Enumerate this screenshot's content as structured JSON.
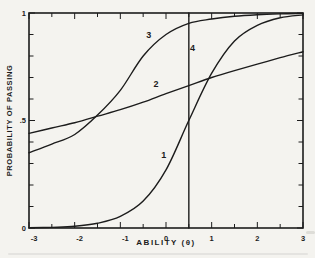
{
  "figure": {
    "background": "#f4f3ef",
    "ink": "#1c1c1c"
  },
  "chart_data": {
    "type": "line",
    "title": "",
    "xlabel": "ABILITY (θ)",
    "ylabel": "PROBABILITY OF PASSING",
    "xlim": [
      -3,
      3
    ],
    "ylim": [
      0,
      1
    ],
    "grid": false,
    "legend_position": "inline-curve-number-labels",
    "x_minor_tick_step": 0.5,
    "y_minor_tick_step": 0.1,
    "x_tick_labels": [
      {
        "value": -3,
        "label": "-3"
      },
      {
        "value": -2,
        "label": "-2"
      },
      {
        "value": -1,
        "label": "-1"
      },
      {
        "value": 0,
        "label": "0"
      },
      {
        "value": 1,
        "label": "1"
      },
      {
        "value": 2,
        "label": "2"
      },
      {
        "value": 3,
        "label": "3"
      }
    ],
    "y_tick_labels": [
      {
        "value": 0,
        "label": "0"
      },
      {
        "value": 0.5,
        "label": ".5"
      },
      {
        "value": 1,
        "label": "1"
      }
    ],
    "series": [
      {
        "name": "item-1",
        "label": "1",
        "label_at": {
          "x": -0.05,
          "y": 0.325
        },
        "shape": "ogive",
        "points": [
          [
            -3,
            0.001
          ],
          [
            -2.5,
            0.003
          ],
          [
            -2,
            0.008
          ],
          [
            -1.5,
            0.022
          ],
          [
            -1,
            0.054
          ],
          [
            -0.5,
            0.125
          ],
          [
            0,
            0.27
          ],
          [
            0.5,
            0.5
          ],
          [
            1,
            0.72
          ],
          [
            1.5,
            0.87
          ],
          [
            2,
            0.943
          ],
          [
            2.5,
            0.978
          ],
          [
            3,
            0.991
          ]
        ]
      },
      {
        "name": "item-2",
        "label": "2",
        "label_at": {
          "x": -0.22,
          "y": 0.655
        },
        "shape": "ogive",
        "points": [
          [
            -3,
            0.44
          ],
          [
            -2.5,
            0.465
          ],
          [
            -2,
            0.49
          ],
          [
            -1.5,
            0.52
          ],
          [
            -1,
            0.55
          ],
          [
            -0.5,
            0.585
          ],
          [
            0,
            0.625
          ],
          [
            0.5,
            0.662
          ],
          [
            1,
            0.7
          ],
          [
            1.5,
            0.732
          ],
          [
            2,
            0.762
          ],
          [
            2.5,
            0.792
          ],
          [
            3,
            0.82
          ]
        ]
      },
      {
        "name": "item-3",
        "label": "3",
        "label_at": {
          "x": -0.38,
          "y": 0.885
        },
        "shape": "ogive",
        "points": [
          [
            -3,
            0.35
          ],
          [
            -2.5,
            0.39
          ],
          [
            -2,
            0.435
          ],
          [
            -1.5,
            0.525
          ],
          [
            -1,
            0.64
          ],
          [
            -0.5,
            0.8
          ],
          [
            0,
            0.9
          ],
          [
            0.5,
            0.952
          ],
          [
            1,
            0.972
          ],
          [
            1.5,
            0.985
          ],
          [
            2,
            0.992
          ],
          [
            2.5,
            0.996
          ],
          [
            3,
            0.998
          ]
        ]
      },
      {
        "name": "item-4",
        "label": "4",
        "label_at": {
          "x": 0.58,
          "y": 0.825
        },
        "shape": "vertical-step",
        "points": [
          [
            0.5,
            0
          ],
          [
            0.5,
            1
          ]
        ]
      }
    ]
  }
}
